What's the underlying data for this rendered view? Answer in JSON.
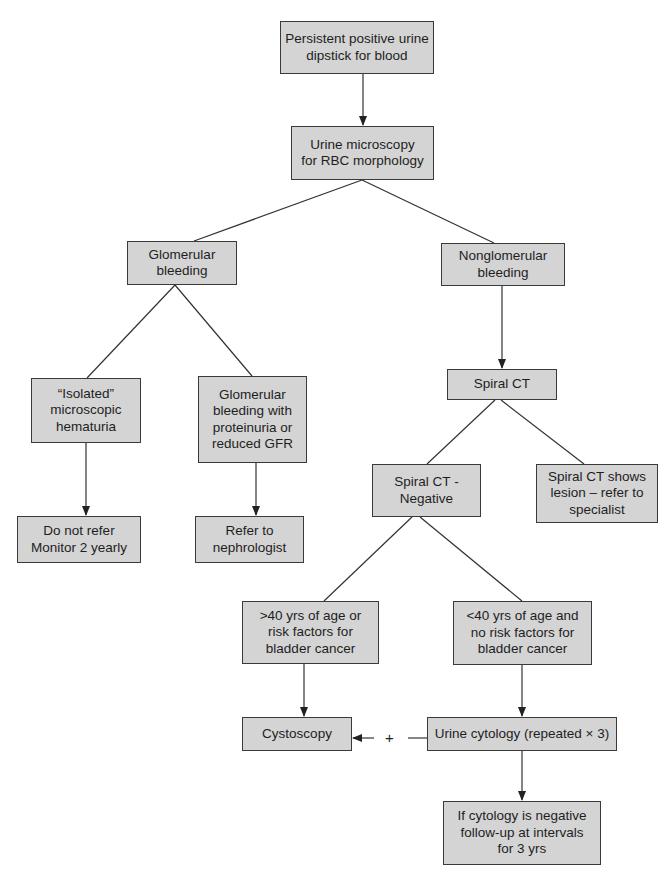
{
  "diagram": {
    "type": "flowchart",
    "colors": {
      "box_fill": "#d4d4d4",
      "box_border": "#3a3a3a",
      "line": "#333333",
      "background": "#ffffff"
    },
    "nodes": {
      "start": "Persistent positive urine\ndipstick for blood",
      "microscopy": "Urine microscopy\nfor RBC morphology",
      "glomerular": "Glomerular\nbleeding",
      "nonglomerular": "Nonglomerular\nbleeding",
      "isolated": "“Isolated”\nmicroscopic\nhematuria",
      "glom_protein": "Glomerular\nbleeding with\nproteinuria or\nreduced GFR",
      "do_not_refer": "Do not refer\nMonitor 2 yearly",
      "refer_nephro": "Refer to\nnephrologist",
      "spiral_ct": "Spiral CT",
      "ct_negative": "Spiral CT -\nNegative",
      "ct_lesion": "Spiral CT shows\nlesion – refer to\nspecialist",
      "over40": ">40 yrs of age or\nrisk factors for\nbladder cancer",
      "under40": "<40 yrs of age and\nno risk factors for\nbladder cancer",
      "cystoscopy": "Cystoscopy",
      "cytology": "Urine cytology (repeated × 3)",
      "followup": "If cytology is negative\nfollow-up at intervals\nfor 3 yrs"
    },
    "edges": [
      {
        "from": "start",
        "to": "microscopy",
        "arrow": true
      },
      {
        "from": "microscopy",
        "to": "glomerular",
        "arrow": false
      },
      {
        "from": "microscopy",
        "to": "nonglomerular",
        "arrow": false
      },
      {
        "from": "glomerular",
        "to": "isolated",
        "arrow": false
      },
      {
        "from": "glomerular",
        "to": "glom_protein",
        "arrow": false
      },
      {
        "from": "isolated",
        "to": "do_not_refer",
        "arrow": true
      },
      {
        "from": "glom_protein",
        "to": "refer_nephro",
        "arrow": true
      },
      {
        "from": "nonglomerular",
        "to": "spiral_ct",
        "arrow": true
      },
      {
        "from": "spiral_ct",
        "to": "ct_negative",
        "arrow": false
      },
      {
        "from": "spiral_ct",
        "to": "ct_lesion",
        "arrow": false
      },
      {
        "from": "ct_negative",
        "to": "over40",
        "arrow": false
      },
      {
        "from": "ct_negative",
        "to": "under40",
        "arrow": false
      },
      {
        "from": "over40",
        "to": "cystoscopy",
        "arrow": true
      },
      {
        "from": "under40",
        "to": "cytology",
        "arrow": true
      },
      {
        "from": "cytology",
        "to": "cystoscopy",
        "arrow": true,
        "label": "+"
      },
      {
        "from": "cytology",
        "to": "followup",
        "arrow": true
      }
    ],
    "plus_label": "+"
  }
}
